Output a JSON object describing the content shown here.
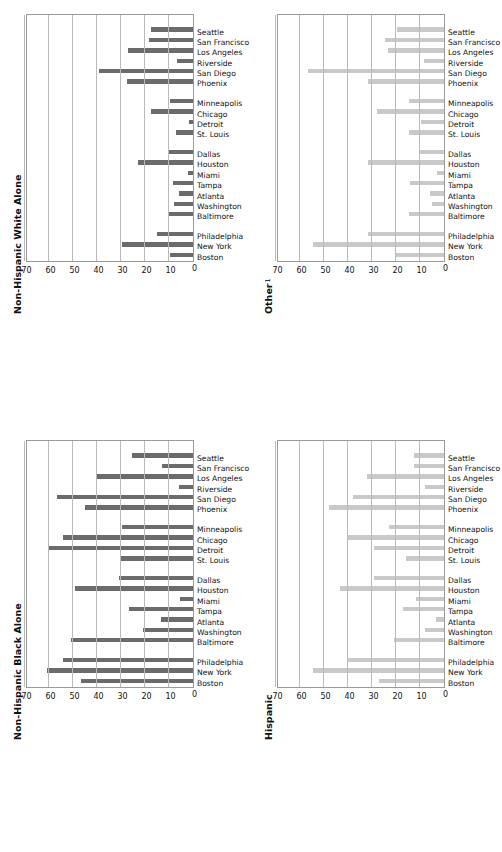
{
  "figure": {
    "orientation": "rotated-90",
    "panel_count": 4,
    "axis_max": 70,
    "axis_min": 0,
    "tick_step": 10,
    "tick_labels": [
      "0",
      "10",
      "20",
      "30",
      "40",
      "50",
      "60",
      "70"
    ],
    "group_gaps_after": [
      2,
      9,
      13
    ],
    "colors": {
      "bar_dark": "#6b6b6b",
      "bar_light": "#c9c9c9",
      "gridline": "#b9b9b9",
      "plot_border": "#9a9a9a",
      "text": "#111111",
      "background": "#ffffff"
    }
  },
  "categories": [
    "Boston",
    "New York",
    "Philadelphia",
    "Baltimore",
    "Washington",
    "Atlanta",
    "Tampa",
    "Miami",
    "Houston",
    "Dallas",
    "St. Louis",
    "Detroit",
    "Chicago",
    "Minneapolis",
    "Phoenix",
    "San Diego",
    "Riverside",
    "Los Angeles",
    "San Francisco",
    "Seattle"
  ],
  "panels": [
    {
      "id": "non-hispanic-white-alone",
      "title": "Non-Hispanic White Alone",
      "superscript": "",
      "bar_color": "#6b6b6b",
      "position": "top-left"
    },
    {
      "id": "other",
      "title": "Other",
      "superscript": "1",
      "bar_color": "#c9c9c9",
      "position": "top-right"
    },
    {
      "id": "non-hispanic-black-alone",
      "title": "Non-Hispanic Black Alone",
      "superscript": "",
      "bar_color": "#6b6b6b",
      "position": "bottom-left"
    },
    {
      "id": "hispanic",
      "title": "Hispanic",
      "superscript": "",
      "bar_color": "#c9c9c9",
      "position": "bottom-right"
    }
  ],
  "chart_data": [
    {
      "type": "bar",
      "title": "Non-Hispanic White Alone",
      "xlabel": "",
      "ylabel": "",
      "ylim": [
        0,
        70
      ],
      "ytick_step": 10,
      "grid": true,
      "legend": "none",
      "bar_color": "#6b6b6b",
      "categories": [
        "Boston",
        "New York",
        "Philadelphia",
        "Baltimore",
        "Washington",
        "Atlanta",
        "Tampa",
        "Miami",
        "Houston",
        "Dallas",
        "St. Louis",
        "Detroit",
        "Chicago",
        "Minneapolis",
        "Phoenix",
        "San Diego",
        "Riverside",
        "Los Angeles",
        "San Francisco",
        "Seattle"
      ],
      "values": [
        9.5,
        29.5,
        15.0,
        10.5,
        8.0,
        6.0,
        8.5,
        2.0,
        23.0,
        10.5,
        7.0,
        1.5,
        17.5,
        9.5,
        27.5,
        39.0,
        6.5,
        27.0,
        18.5,
        17.5
      ]
    },
    {
      "type": "bar",
      "title": "Other",
      "title_superscript": "1",
      "xlabel": "",
      "ylabel": "",
      "ylim": [
        0,
        70
      ],
      "ytick_step": 10,
      "grid": true,
      "legend": "none",
      "bar_color": "#c9c9c9",
      "categories": [
        "Boston",
        "New York",
        "Philadelphia",
        "Baltimore",
        "Washington",
        "Atlanta",
        "Tampa",
        "Miami",
        "Houston",
        "Dallas",
        "St. Louis",
        "Detroit",
        "Chicago",
        "Minneapolis",
        "Phoenix",
        "San Diego",
        "Riverside",
        "Los Angeles",
        "San Francisco",
        "Seattle"
      ],
      "values": [
        20.0,
        54.5,
        31.5,
        14.5,
        5.0,
        6.0,
        14.0,
        3.0,
        31.5,
        10.5,
        14.5,
        9.5,
        28.0,
        14.5,
        31.5,
        56.5,
        8.5,
        23.5,
        24.5,
        19.5
      ]
    },
    {
      "type": "bar",
      "title": "Non-Hispanic Black Alone",
      "xlabel": "",
      "ylabel": "",
      "ylim": [
        0,
        70
      ],
      "ytick_step": 10,
      "grid": true,
      "legend": "none",
      "bar_color": "#6b6b6b",
      "categories": [
        "Boston",
        "New York",
        "Philadelphia",
        "Baltimore",
        "Washington",
        "Atlanta",
        "Tampa",
        "Miami",
        "Houston",
        "Dallas",
        "St. Louis",
        "Detroit",
        "Chicago",
        "Minneapolis",
        "Phoenix",
        "San Diego",
        "Riverside",
        "Los Angeles",
        "San Francisco",
        "Seattle"
      ],
      "values": [
        46.5,
        61.0,
        54.0,
        51.0,
        21.0,
        13.5,
        26.5,
        5.5,
        49.0,
        31.0,
        30.5,
        60.5,
        54.0,
        29.5,
        45.0,
        56.5,
        6.0,
        40.0,
        13.0,
        25.5
      ]
    },
    {
      "type": "bar",
      "title": "Hispanic",
      "xlabel": "",
      "ylabel": "",
      "ylim": [
        0,
        70
      ],
      "ytick_step": 10,
      "grid": true,
      "legend": "none",
      "bar_color": "#c9c9c9",
      "categories": [
        "Boston",
        "New York",
        "Philadelphia",
        "Baltimore",
        "Washington",
        "Atlanta",
        "Tampa",
        "Miami",
        "Houston",
        "Dallas",
        "St. Louis",
        "Detroit",
        "Chicago",
        "Minneapolis",
        "Phoenix",
        "San Diego",
        "Riverside",
        "Los Angeles",
        "San Francisco",
        "Seattle"
      ],
      "values": [
        27.0,
        54.5,
        40.0,
        21.0,
        8.0,
        3.5,
        17.0,
        11.5,
        43.5,
        29.0,
        16.0,
        29.0,
        40.5,
        23.0,
        48.0,
        38.0,
        8.0,
        32.0,
        12.5,
        12.5
      ]
    }
  ]
}
